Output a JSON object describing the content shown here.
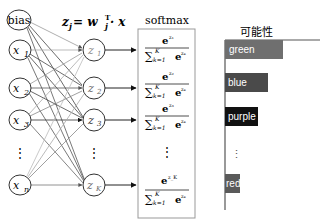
{
  "formula": {
    "text": "z_j = w_j^T · x",
    "lhs": "z",
    "sub": "j",
    "eq": " = w",
    "sup": "T",
    "rhs": " · x"
  },
  "input_layer": {
    "nodes": [
      {
        "label": "bias",
        "sub": ""
      },
      {
        "label": "x",
        "sub": "1"
      },
      {
        "label": "x",
        "sub": "2"
      },
      {
        "label": "x",
        "sub": "3"
      },
      {
        "label": "x",
        "sub": "n"
      }
    ],
    "ellipsis": "⋮"
  },
  "output_layer": {
    "nodes": [
      {
        "label": "z",
        "sub": "1"
      },
      {
        "label": "z",
        "sub": "2"
      },
      {
        "label": "z",
        "sub": "3"
      },
      {
        "label": "z",
        "sub": "K"
      }
    ],
    "ellipsis": "⋮"
  },
  "softmax": {
    "title": "softmax",
    "entries": [
      {
        "num": "e",
        "num_sup": "z₁",
        "den_sum": "∑",
        "den_sup": "K",
        "den_sub": "k=1",
        "den_e": "e",
        "den_e_sup": "zₖ"
      },
      {
        "num": "e",
        "num_sup": "z₂",
        "den_sum": "∑",
        "den_sup": "K",
        "den_sub": "k=1",
        "den_e": "e",
        "den_e_sup": "zₖ"
      },
      {
        "num": "e",
        "num_sup": "z₃",
        "den_sum": "∑",
        "den_sup": "K",
        "den_sub": "k=1",
        "den_e": "e",
        "den_e_sup": "zₖ"
      },
      {
        "num": "e",
        "num_sup": "z_K",
        "den_sum": "∑",
        "den_sup": "K",
        "den_sub": "k=1",
        "den_e": "e",
        "den_e_sup": "zₖ"
      }
    ],
    "ellipsis": "⋮"
  },
  "probability_chart": {
    "title": "可能性",
    "ellipsis": "⋮",
    "bars": [
      {
        "label": "green",
        "width": 58,
        "color": "#6f6f6f"
      },
      {
        "label": "blue",
        "width": 43,
        "color": "#4a4a4a"
      },
      {
        "label": "purple",
        "width": 33,
        "color": "#111111"
      },
      {
        "label": "red",
        "width": 15,
        "color": "#5a5a5a"
      }
    ]
  }
}
